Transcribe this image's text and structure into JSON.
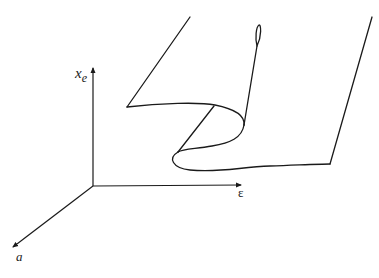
{
  "diagram": {
    "type": "cusp-catastrophe-surface",
    "axes": {
      "vertical": {
        "label": "x",
        "subscript": "e"
      },
      "horizontal": {
        "label": "ε"
      },
      "depth": {
        "label": "a"
      }
    },
    "colors": {
      "background": "#ffffff",
      "stroke": "#1a1a1a"
    }
  }
}
